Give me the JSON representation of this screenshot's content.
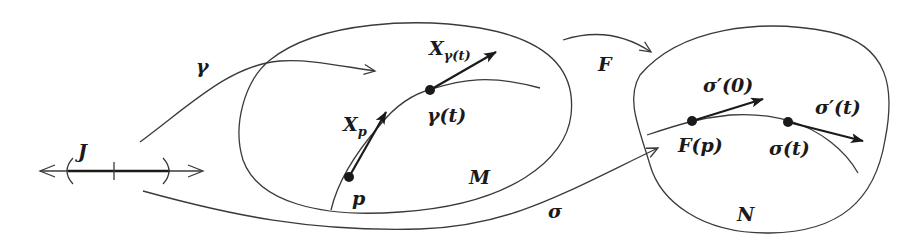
{
  "diagram": {
    "type": "differential-geometry-figure",
    "labels": {
      "J": "J",
      "gamma": "γ",
      "F": "F",
      "sigma": "σ",
      "M": "M",
      "N": "N",
      "p": "p",
      "X_p_base": "X",
      "X_p_sub": "p",
      "X_gamma_base": "X",
      "X_gamma_sub": "γ(t)",
      "gamma_t": "γ(t)",
      "F_p": "F(p)",
      "sigma_t": "σ(t)",
      "sigma_prime_0": "σ′(0)",
      "sigma_prime_t": "σ′(t)"
    },
    "elements": {
      "interval": "open interval J on real line with tick at center",
      "manifold_M": "ellipse containing curve γ through p and γ(t)",
      "manifold_N": "rounded region containing curve σ through F(p) and σ(t)",
      "map_gamma": "arrow from J to M",
      "map_F": "arrow from M to N",
      "map_sigma": "arrow from J to N"
    },
    "colors": {
      "ink": "#1a1a1a",
      "thin_line": "#3a3a3a",
      "background": "#ffffff"
    }
  }
}
